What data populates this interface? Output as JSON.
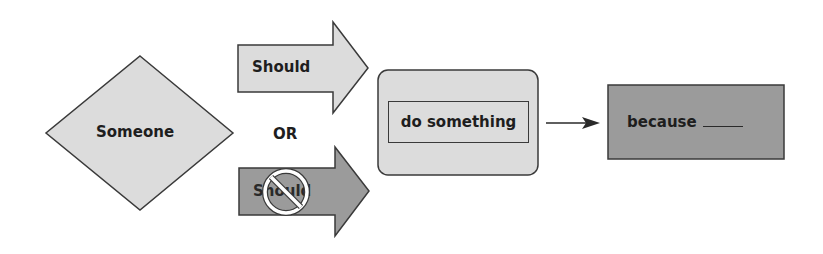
{
  "diagram": {
    "subject": {
      "label": "Someone",
      "shape": "diamond"
    },
    "connector": {
      "label": "OR"
    },
    "options": [
      {
        "label": "Should",
        "shape": "arrow",
        "style": "allowed"
      },
      {
        "label": "Should",
        "shape": "arrow",
        "style": "prohibited",
        "icon": "prohibition-icon"
      }
    ],
    "action": {
      "label": "do something",
      "shape": "rounded-box"
    },
    "reason": {
      "label": "because",
      "blank": "______",
      "shape": "box"
    },
    "link_icon": "arrow-right-icon"
  },
  "colors": {
    "light_fill": "#dcdcdc",
    "dark_fill": "#9b9b9b",
    "stroke": "#3a3a3a",
    "text": "#1e1e1e",
    "background": "#ffffff"
  }
}
